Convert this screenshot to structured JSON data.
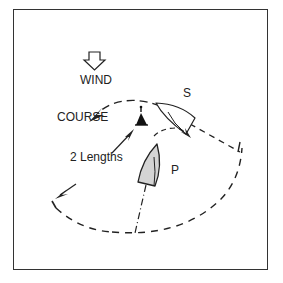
{
  "diagram": {
    "labels": {
      "wind": "WIND",
      "course": "COURSE",
      "boat_s": "S",
      "boat_p": "P",
      "distance": "2 Lengths"
    },
    "icons": {
      "wind": "hollow-down-arrow-icon",
      "mark": "buoy-mark-icon"
    },
    "colors": {
      "line": "#222222",
      "boat_p_fill": "#d4d4d4",
      "frame": "#333333",
      "background": "#ffffff"
    }
  }
}
